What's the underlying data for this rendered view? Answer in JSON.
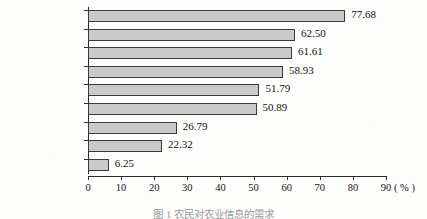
{
  "chart_data": {
    "type": "bar",
    "orientation": "horizontal",
    "title": "",
    "xlabel": "(%)",
    "ylabel": "",
    "xlim": [
      0,
      90
    ],
    "xticks": [
      0,
      10,
      20,
      30,
      40,
      50,
      60,
      70,
      80,
      90
    ],
    "grid": false,
    "legend": null,
    "categories": [
      "农产品市场信息",
      "农业科技",
      "农业政策",
      "农业致富",
      "农业法律法规",
      "农资信息",
      "农产品出口",
      "国外农业发展",
      "其他"
    ],
    "values": [
      77.68,
      62.5,
      61.61,
      58.93,
      51.79,
      50.89,
      26.79,
      22.32,
      6.25
    ],
    "value_labels": [
      "77.68",
      "62.50",
      "61.61",
      "58.93",
      "51.79",
      "50.89",
      "26.79",
      "22.32",
      "6.25"
    ],
    "tick_labels": [
      "0",
      "10",
      "20",
      "30",
      "40",
      "50",
      "60",
      "70",
      "80",
      "90"
    ],
    "axis_unit": "( % )",
    "bar_color": "#c9c9c9",
    "bar_border_color": "#3a3a3a",
    "axis_color": "#2b2b2b"
  },
  "caption": {
    "text": "图 1   农民对农业信息的需求"
  }
}
